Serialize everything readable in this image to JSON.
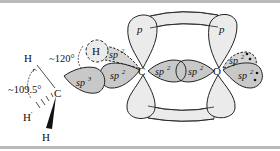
{
  "diagram": {
    "colors": {
      "lobe_light": "#ebebeb",
      "lobe_dark": "#c8c8c8",
      "stroke": "#222222",
      "rule": "#b9b9b9"
    },
    "atoms": {
      "carbon_methyl": "C",
      "carbon_carbonyl": "C",
      "oxygen": "O",
      "h_top": "H",
      "h_back": "H",
      "h_wedge": "H",
      "h_aldehyde": "H"
    },
    "angles": {
      "tetrahedral": "~109.5°",
      "trigonal": "~120°"
    },
    "orbitals": {
      "p_carbon": "p",
      "p_oxygen": "p",
      "sp3_methyl": "sp",
      "sp3_sup": "3",
      "sp2": "sp",
      "sp2_sup": "2"
    },
    "lone_pairs": 2
  }
}
